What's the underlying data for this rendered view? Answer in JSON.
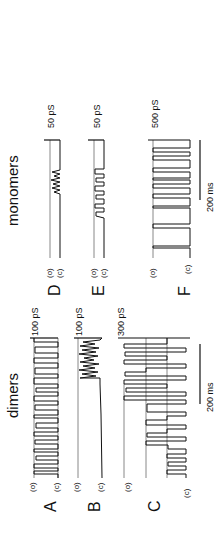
{
  "figure": {
    "orientation": "rotated-90-ccw",
    "groups": [
      {
        "title": "dimers"
      },
      {
        "title": "monomers"
      }
    ],
    "panels": [
      {
        "label": "A",
        "group": "dimers",
        "state_open": "(o)",
        "state_closed": "(c)",
        "scale": "100 pS"
      },
      {
        "label": "B",
        "group": "dimers",
        "state_open": "(o)",
        "state_closed": "(c)",
        "scale": "100 pS"
      },
      {
        "label": "C",
        "group": "dimers",
        "state_open": "(o)",
        "state_closed": "(c)",
        "scale": "300 pS"
      },
      {
        "label": "D",
        "group": "monomers",
        "state_open": "(o)",
        "state_closed": "(c)",
        "scale": "50 pS"
      },
      {
        "label": "E",
        "group": "monomers",
        "state_open": "(o)",
        "state_closed": "(c)",
        "scale": "50 pS"
      },
      {
        "label": "F",
        "group": "monomers",
        "state_open": "(o)",
        "state_closed": "(c)",
        "scale": "500 pS"
      }
    ],
    "time_scale": [
      {
        "group": "dimers",
        "label": "200 ms"
      },
      {
        "group": "monomers",
        "label": "200 ms"
      }
    ],
    "colors": {
      "ink": "#111111",
      "background": "#ffffff"
    }
  }
}
